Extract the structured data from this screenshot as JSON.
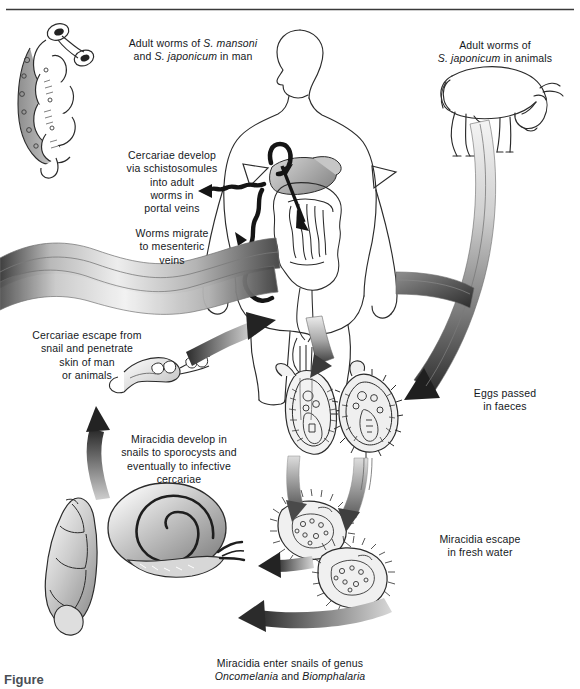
{
  "figure": {
    "top_rule": true,
    "labels": {
      "adult_worms_man": "Adult worms of S. mansoni\nand S. japonicum in man",
      "adult_worms_animals": "Adult worms of\nS. japonicum in animals",
      "cercariae_develop": "Cercariae develop\nvia schistosomules\ninto adult\nworms in\nportal veins",
      "worms_migrate": "Worms migrate\nto mesenteric\nveins",
      "cercariae_escape": "Cercariae escape from\nsnail and penetrate\nskin of man\nor animals",
      "miracidia_develop": "Miracidia develop in\nsnails to sporocysts and\neventually to infective\ncercariae",
      "eggs_passed": "Eggs passed\nin faeces",
      "miracidia_escape": "Miracidia escape\nin fresh water",
      "miracidia_enter": "Miracidia enter snails of genus\nOncomelania and Biomphalaria"
    },
    "italic_terms": {
      "s_mansoni": "S. mansoni",
      "s_japonicum": "S. japonicum",
      "oncomelania": "Oncomelania",
      "biomphalaria": "Biomphalaria"
    },
    "caption_label": "Figure",
    "caption_number": "",
    "caption_text": ""
  },
  "colors": {
    "ink": "#15181c",
    "outline": "#2b2b2b",
    "arrow_dark": "#2a2a2a",
    "grey_light": "#e9e9e9",
    "grey_mid": "#9a9a9a",
    "grey_dark": "#4a4a4a",
    "page_background": "#ffffff",
    "rule": "#3a3a3a"
  },
  "organisms": {
    "adult_worm_pair": "adult worm pair in copula",
    "cow": "bovine definitive host",
    "human": "human definitive host",
    "cercaria": "forked-tail cercaria",
    "egg_lateral_spine": "S. mansoni egg with lateral spine",
    "egg_round": "S. japonicum egg",
    "miracidium_a": "free-swimming miracidium",
    "miracidium_b": "free-swimming miracidium",
    "snail_planorbid": "Biomphalaria snail",
    "snail_operculate": "Oncomelania snail"
  }
}
